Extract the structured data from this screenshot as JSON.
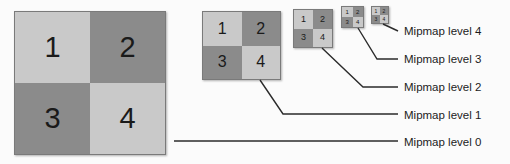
{
  "figure": {
    "background_color": "#fbfbfb",
    "colors": {
      "light_gray": "#c9c9c9",
      "dark_gray": "#8b8b8b",
      "border": "#7a7a7a",
      "line": "#2b2b2b",
      "text": "#1b1b1b"
    }
  },
  "quadrant_labels": {
    "top_left": "1",
    "top_right": "2",
    "bottom_left": "3",
    "bottom_right": "4"
  },
  "mipmaps": [
    {
      "level": 0,
      "label": "Mipmap level 0",
      "size_px": 152,
      "cells": [
        {
          "text": "1",
          "shade": "light"
        },
        {
          "text": "2",
          "shade": "dark"
        },
        {
          "text": "3",
          "shade": "dark"
        },
        {
          "text": "4",
          "shade": "light"
        }
      ]
    },
    {
      "level": 1,
      "label": "Mipmap level 1",
      "size_px": 79,
      "cells": [
        {
          "text": "1",
          "shade": "light"
        },
        {
          "text": "2",
          "shade": "dark"
        },
        {
          "text": "3",
          "shade": "dark"
        },
        {
          "text": "4",
          "shade": "light"
        }
      ]
    },
    {
      "level": 2,
      "label": "Mipmap level 2",
      "size_px": 40,
      "cells": [
        {
          "text": "1",
          "shade": "light"
        },
        {
          "text": "2",
          "shade": "dark"
        },
        {
          "text": "3",
          "shade": "dark"
        },
        {
          "text": "4",
          "shade": "light"
        }
      ]
    },
    {
      "level": 3,
      "label": "Mipmap level 3",
      "size_px": 23,
      "cells": [
        {
          "text": "1",
          "shade": "light"
        },
        {
          "text": "2",
          "shade": "dark"
        },
        {
          "text": "3",
          "shade": "dark"
        },
        {
          "text": "4",
          "shade": "light"
        }
      ]
    },
    {
      "level": 4,
      "label": "Mipmap level 4",
      "size_px": 18,
      "cells": [
        {
          "text": "1",
          "shade": "light"
        },
        {
          "text": "2",
          "shade": "dark"
        },
        {
          "text": "3",
          "shade": "dark"
        },
        {
          "text": "4",
          "shade": "light"
        }
      ]
    }
  ]
}
